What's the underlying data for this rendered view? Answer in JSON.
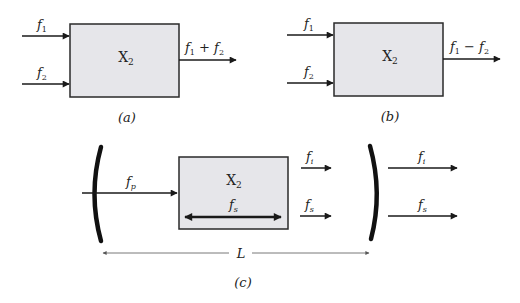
{
  "colors": {
    "box_fill": "#e6e6ea",
    "box_stroke": "#2a2a2a",
    "line": "#1a1a1a",
    "length_line": "#555555"
  },
  "panel_a": {
    "caption": "(a)",
    "box_label": "X",
    "box_label_sub": "2",
    "inputs": [
      {
        "symbol": "f",
        "sub": "1"
      },
      {
        "symbol": "f",
        "sub": "2"
      }
    ],
    "output": {
      "text": "f",
      "sub1": "1",
      "op": " + ",
      "text2": "f",
      "sub2": "2"
    }
  },
  "panel_b": {
    "caption": "(b)",
    "box_label": "X",
    "box_label_sub": "2",
    "inputs": [
      {
        "symbol": "f",
        "sub": "1"
      },
      {
        "symbol": "f",
        "sub": "2"
      }
    ],
    "output": {
      "text": "f",
      "sub1": "1",
      "op": " − ",
      "text2": "f",
      "sub2": "2"
    }
  },
  "panel_c": {
    "caption": "(c)",
    "box_label": "X",
    "box_label_sub": "2",
    "pump": {
      "symbol": "f",
      "sub": "p"
    },
    "internal": {
      "symbol": "f",
      "sub": "s"
    },
    "inner_outputs": [
      {
        "symbol": "f",
        "sub": "i"
      },
      {
        "symbol": "f",
        "sub": "s"
      }
    ],
    "outer_outputs": [
      {
        "symbol": "f",
        "sub": "i"
      },
      {
        "symbol": "f",
        "sub": "s"
      }
    ],
    "cavity_length": "L"
  }
}
